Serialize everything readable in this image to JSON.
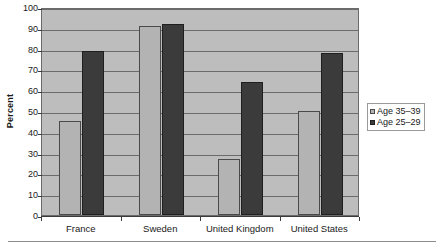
{
  "chart_data": {
    "type": "bar",
    "title": "",
    "subtitle": "",
    "xlabel": "",
    "ylabel": "Percent",
    "ylim": [
      0,
      100
    ],
    "ytick_step": 10,
    "yticks": [
      0,
      10,
      20,
      30,
      40,
      50,
      60,
      70,
      80,
      90,
      100
    ],
    "grid": true,
    "legend_position": "right",
    "categories": [
      "France",
      "Sweden",
      "United Kingdom",
      "United States"
    ],
    "series": [
      {
        "name": "Age 35–39",
        "color": "#b3b3b3",
        "values": [
          45,
          91,
          27,
          50
        ]
      },
      {
        "name": "Age 25–29",
        "color": "#3b3b3b",
        "values": [
          79,
          92,
          64,
          78
        ]
      }
    ]
  },
  "legend": {
    "items": [
      {
        "label": "Age 35–39"
      },
      {
        "label": "Age 25–29"
      }
    ]
  },
  "axes": {
    "y_title": "Percent"
  },
  "colors": {
    "plot_background": "#bdbdbd",
    "plot_border": "#6b6b6b",
    "gridline": "#6b6b6b",
    "series_light": "#b3b3b3",
    "series_dark": "#3b3b3b",
    "text": "#1a1a1a",
    "footer_rule": "#8c8c8c"
  }
}
